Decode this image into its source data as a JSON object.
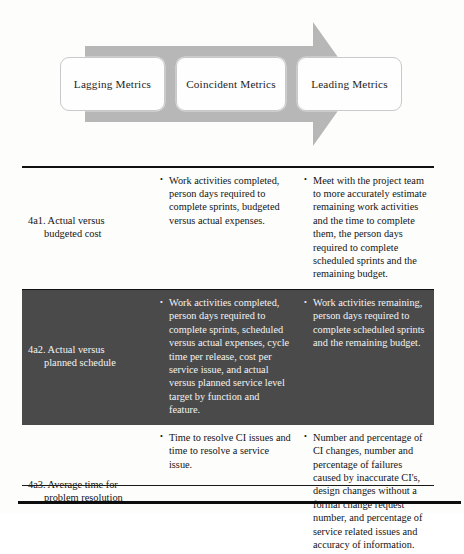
{
  "diagram": {
    "name": "metrics-progression-arrow",
    "arrow_color": "#b7b7b7",
    "box_fill": "#fefefe",
    "box_border": "#c9c9c9",
    "stages": [
      {
        "label": "Lagging Metrics"
      },
      {
        "label": "Coincident Metrics"
      },
      {
        "label": "Leading Metrics"
      }
    ]
  },
  "table": {
    "name": "metrics-table",
    "highlight_color": "#4a4a4a",
    "rows": [
      {
        "id": "4a1",
        "title_line1": "4a1. Actual versus",
        "title_line2": "budgeted cost",
        "highlighted": false,
        "coincident": [
          "Work activities completed, person days required to complete sprints, budgeted versus actual expenses."
        ],
        "leading": [
          "Meet with the project team to more accurately estimate remaining work activities and the time to complete them, the person days required to complete scheduled sprints and the remaining budget."
        ]
      },
      {
        "id": "4a2",
        "title_line1": "4a2. Actual versus",
        "title_line2": "planned schedule",
        "highlighted": true,
        "coincident": [
          "Work activities completed, person days required to complete sprints, scheduled versus actual expenses, cycle time per release, cost per service issue, and actual versus planned service level target by function and feature."
        ],
        "leading": [
          "Work activities remaining, person days required to complete scheduled sprints and the remaining budget."
        ]
      },
      {
        "id": "4a3",
        "title_line1": "4a3. Average time for",
        "title_line2": "problem resolution",
        "highlighted": false,
        "coincident": [
          "Time to resolve CI issues and time to resolve a service issue."
        ],
        "leading": [
          "Number and percentage of CI changes, number and percentage of failures caused by inaccurate CI's, design changes without a formal change request number, and percentage of service related issues and accuracy of information."
        ]
      }
    ]
  }
}
